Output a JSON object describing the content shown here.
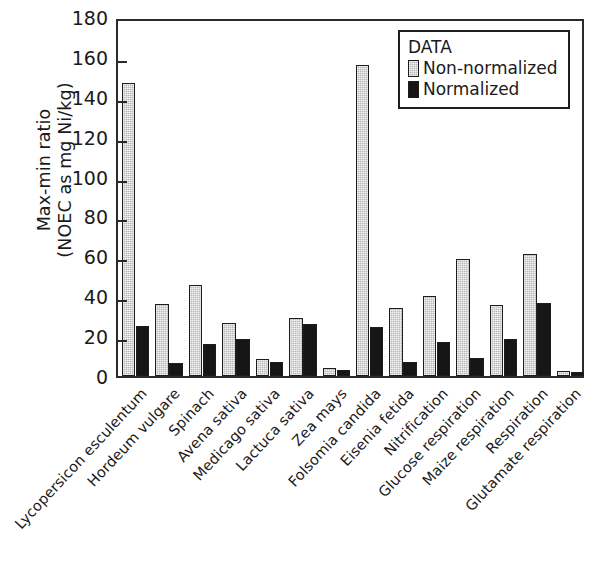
{
  "chart_data": {
    "type": "bar",
    "title": "",
    "subtitle": "",
    "xlabel": "",
    "ylabel": "Max-min ratio (NOEC as mg Ni/kg)",
    "ylabel_lines": [
      "Max-min ratio",
      "(NOEC as mg Ni/kg)"
    ],
    "ylim": [
      0,
      180
    ],
    "ytick_step": 20,
    "yticks": [
      0,
      20,
      40,
      60,
      80,
      100,
      120,
      140,
      160,
      180
    ],
    "ytick_labels": [
      "0",
      "20",
      "40",
      "60",
      "80",
      "100",
      "120",
      "140",
      "160",
      "180"
    ],
    "grid": false,
    "legend_position": "top-right",
    "legend_title": "DATA",
    "categories": [
      "Lycopersicon esculentum",
      "Hordeum vulgare",
      "Spinach",
      "Avena sativa",
      "Medicago sativa",
      "Lactuca sativa",
      "Zea mays",
      "Folsomia candida",
      "Eisenia fetida",
      "Nitrification",
      "Glucose respiration",
      "Maize respiration",
      "Respiration",
      "Glutamate respiration"
    ],
    "series": [
      {
        "name": "Non-normalized",
        "color": "#b9b9b9",
        "values": [
          147,
          36,
          45.5,
          26.5,
          8.5,
          29,
          4,
          156,
          34,
          40,
          58.5,
          35.5,
          61,
          2.5
        ]
      },
      {
        "name": "Normalized",
        "color": "#161616",
        "values": [
          25,
          6.5,
          16,
          18.5,
          7,
          26,
          3,
          24.5,
          7,
          17,
          9,
          18.5,
          36.5,
          2
        ]
      }
    ]
  },
  "legend": {
    "title": "DATA",
    "entries": [
      {
        "label": "Non-normalized",
        "swatch": "nonnorm"
      },
      {
        "label": "Normalized",
        "swatch": "norm"
      }
    ]
  }
}
